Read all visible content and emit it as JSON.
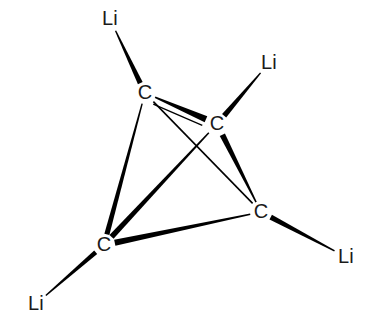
{
  "figure": {
    "kind": "molecular-structure-diagram",
    "title": "",
    "background_color": "#ffffff",
    "bond_color": "#000000",
    "label_color": "#1a1a1a",
    "width": 369,
    "height": 332
  },
  "atoms": [
    {
      "id": "C1",
      "element": "C",
      "label": "C",
      "x": 145,
      "y": 93,
      "role": "cage-vertex"
    },
    {
      "id": "C2",
      "element": "C",
      "label": "C",
      "x": 217,
      "y": 124,
      "role": "cage-vertex"
    },
    {
      "id": "C3",
      "element": "C",
      "label": "C",
      "x": 104,
      "y": 245,
      "role": "cage-vertex"
    },
    {
      "id": "C4",
      "element": "C",
      "label": "C",
      "x": 261,
      "y": 212,
      "role": "cage-vertex"
    },
    {
      "id": "Li1",
      "element": "Li",
      "label": "Li",
      "x": 110,
      "y": 19,
      "role": "terminal"
    },
    {
      "id": "Li2",
      "element": "Li",
      "label": "Li",
      "x": 269,
      "y": 63,
      "role": "terminal"
    },
    {
      "id": "Li3",
      "element": "Li",
      "label": "Li",
      "x": 346,
      "y": 257,
      "role": "terminal"
    },
    {
      "id": "Li4",
      "element": "Li",
      "label": "Li",
      "x": 36,
      "y": 304,
      "role": "terminal"
    }
  ],
  "bonds": [
    {
      "id": "b-Li1-C1",
      "from": "Li1",
      "to": "C1",
      "style": "wedge",
      "w_from": 1.4,
      "w_to": 5.2,
      "gap_from": 13,
      "gap_to": 11
    },
    {
      "id": "b-Li2-C2",
      "from": "Li2",
      "to": "C2",
      "style": "wedge",
      "w_from": 1.4,
      "w_to": 5.4,
      "gap_from": 13,
      "gap_to": 11
    },
    {
      "id": "b-C4-Li3",
      "from": "C4",
      "to": "Li3",
      "style": "wedge",
      "w_from": 5.2,
      "w_to": 1.6,
      "gap_from": 11,
      "gap_to": 13
    },
    {
      "id": "b-C3-Li4",
      "from": "C3",
      "to": "Li4",
      "style": "wedge",
      "w_from": 4.6,
      "w_to": 1.4,
      "gap_from": 11,
      "gap_to": 13
    },
    {
      "id": "b-C1-C2",
      "from": "C1",
      "to": "C2",
      "style": "wedge",
      "w_from": 1.6,
      "w_to": 6.6,
      "gap_from": 11,
      "gap_to": 12
    },
    {
      "id": "b-C1-C2-thin",
      "from": "C1",
      "to": "C2",
      "style": "line",
      "width": 1.3,
      "gap_from": 12,
      "gap_to": 13,
      "offset": 7
    },
    {
      "id": "b-C1-C3",
      "from": "C1",
      "to": "C3",
      "style": "wedge",
      "w_from": 1.4,
      "w_to": 5.2,
      "gap_from": 11,
      "gap_to": 11
    },
    {
      "id": "b-C1-C4",
      "from": "C1",
      "to": "C4",
      "style": "line",
      "width": 1.6,
      "gap_from": 12,
      "gap_to": 12,
      "offset": 0
    },
    {
      "id": "b-C3-C2",
      "from": "C3",
      "to": "C2",
      "style": "wedge",
      "w_from": 5.6,
      "w_to": 1.5,
      "gap_from": 11,
      "gap_to": 12
    },
    {
      "id": "b-C2-C4",
      "from": "C2",
      "to": "C4",
      "style": "wedge",
      "w_from": 5.8,
      "w_to": 1.5,
      "gap_from": 12,
      "gap_to": 11
    },
    {
      "id": "b-C3-C4",
      "from": "C3",
      "to": "C4",
      "style": "wedge",
      "w_from": 6.2,
      "w_to": 1.6,
      "gap_from": 11,
      "gap_to": 11
    }
  ],
  "chart_data": {
    "type": "diagram",
    "title": "",
    "nodes": [
      "C",
      "C",
      "C",
      "C",
      "Li",
      "Li",
      "Li",
      "Li"
    ],
    "edges": [
      [
        "Li",
        "C"
      ],
      [
        "Li",
        "C"
      ],
      [
        "C",
        "Li"
      ],
      [
        "C",
        "Li"
      ],
      [
        "C",
        "C"
      ],
      [
        "C",
        "C"
      ],
      [
        "C",
        "C"
      ],
      [
        "C",
        "C"
      ],
      [
        "C",
        "C"
      ],
      [
        "C",
        "C"
      ]
    ]
  }
}
